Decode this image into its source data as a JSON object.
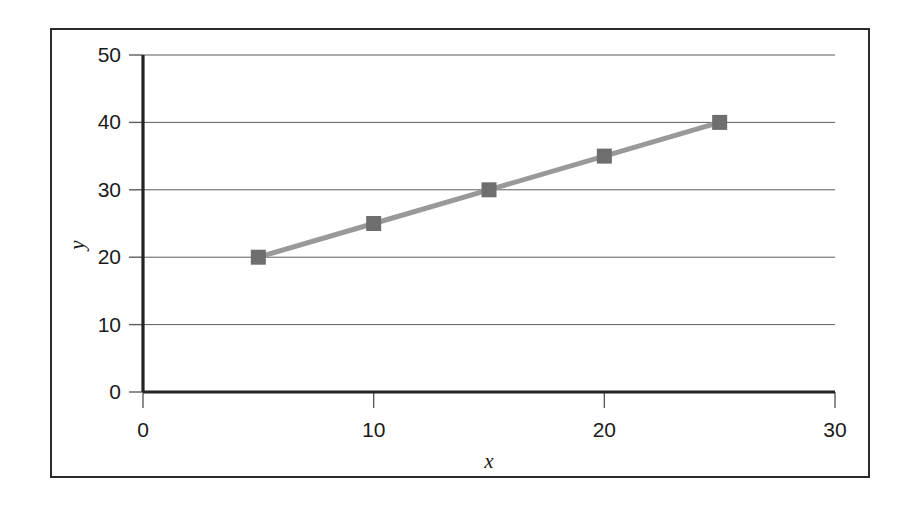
{
  "chart_data": {
    "type": "line",
    "title": "",
    "subtitle": "",
    "xlabel": "x",
    "ylabel": "y",
    "xlim": [
      0,
      30
    ],
    "ylim": [
      0,
      50
    ],
    "xticks": [
      0,
      10,
      20,
      30
    ],
    "yticks": [
      0,
      10,
      20,
      30,
      40,
      50
    ],
    "xtick_labels": [
      "0",
      "10",
      "20",
      "30"
    ],
    "ytick_labels": [
      "0",
      "10",
      "20",
      "30",
      "40",
      "50"
    ],
    "grid": "horizontal",
    "legend": "none",
    "marker": "square",
    "line_color": "#999999",
    "marker_color": "#6e6e6e",
    "axis_color": "#232323",
    "gridline_color": "#5d5d5d",
    "series": [
      {
        "name": "series-1",
        "x": [
          5,
          10,
          15,
          20,
          25
        ],
        "y": [
          20,
          25,
          30,
          35,
          40
        ]
      }
    ],
    "points": [
      {
        "x": 5,
        "y": 20
      },
      {
        "x": 10,
        "y": 25
      },
      {
        "x": 15,
        "y": 30
      },
      {
        "x": 20,
        "y": 35
      },
      {
        "x": 25,
        "y": 40
      }
    ]
  },
  "figure": {
    "border_color": "#2b2b2b",
    "background": "#ffffff"
  }
}
